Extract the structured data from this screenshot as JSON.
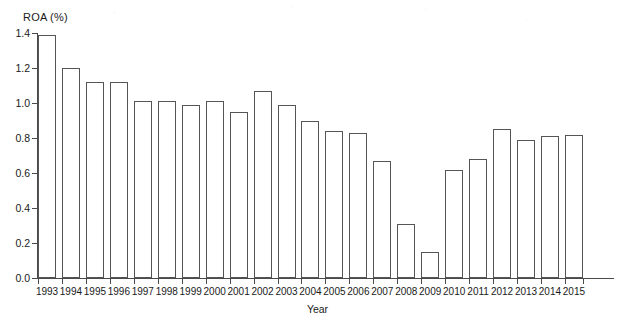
{
  "chart_data": {
    "type": "bar",
    "title": "",
    "xlabel": "Year",
    "ylabel": "ROA (%)",
    "ylim": [
      0.0,
      1.4
    ],
    "ytick_labels": [
      "0.0",
      "0.2",
      "0.4",
      "0.6",
      "0.8",
      "1.0",
      "1.2",
      "1.4"
    ],
    "ytick_values": [
      0.0,
      0.2,
      0.4,
      0.6,
      0.8,
      1.0,
      1.2,
      1.4
    ],
    "grid": false,
    "legend": "none",
    "bar_style": {
      "fill": "#ffffff",
      "edge": "#555555"
    },
    "categories": [
      "1993",
      "1994",
      "1995",
      "1996",
      "1997",
      "1998",
      "1999",
      "2000",
      "2001",
      "2002",
      "2003",
      "2004",
      "2005",
      "2006",
      "2007",
      "2008",
      "2009",
      "2010",
      "2011",
      "2012",
      "2013",
      "2014",
      "2015"
    ],
    "values": [
      1.39,
      1.2,
      1.12,
      1.12,
      1.01,
      1.01,
      0.99,
      1.01,
      0.95,
      1.07,
      0.99,
      0.9,
      0.84,
      0.83,
      0.67,
      0.31,
      0.15,
      0.62,
      0.68,
      0.85,
      0.79,
      0.81,
      0.82
    ]
  }
}
